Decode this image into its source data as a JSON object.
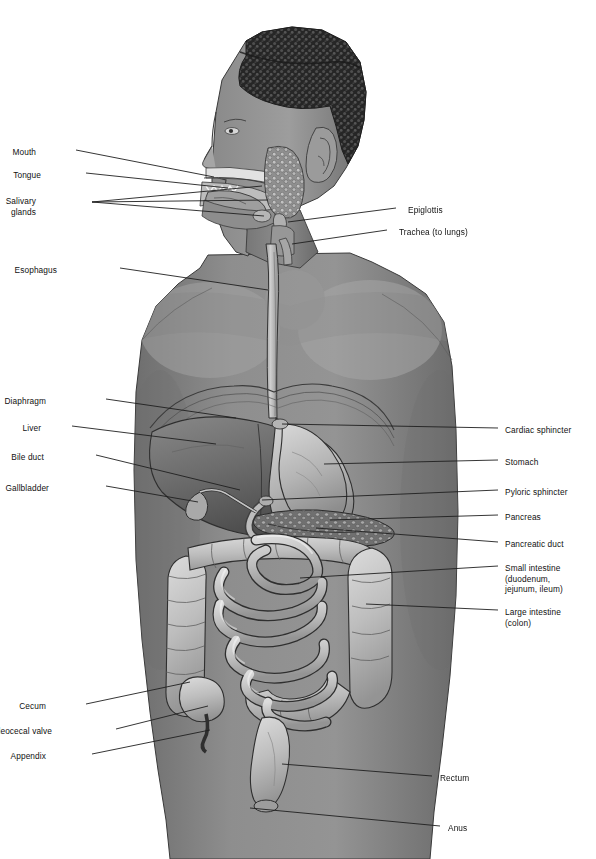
{
  "diagram": {
    "view": "lateral/anterior anatomical illustration",
    "style": "grayscale medical illustration",
    "palette": {
      "background": "#ffffff",
      "skin_light": "#9a9a9a",
      "skin_mid": "#808080",
      "skin_dark": "#6a6a6a",
      "organ_light": "#c9c9c9",
      "organ_mid": "#a3a3a3",
      "organ_dark": "#5d5d5d",
      "liver": "#6f6f6f",
      "hair": "#2a2a2a",
      "outline": "#2b2b2b",
      "leader_line": "#1f1f1f"
    }
  },
  "labels_left": [
    {
      "id": "mouth",
      "text": "Mouth",
      "x": 36,
      "y": 147
    },
    {
      "id": "tongue",
      "text": "Tongue",
      "x": 41,
      "y": 170
    },
    {
      "id": "salivary-glands",
      "text": "Salivary\nglands",
      "x": 36,
      "y": 196
    },
    {
      "id": "esophagus",
      "text": "Esophagus",
      "x": 57,
      "y": 265
    },
    {
      "id": "diaphragm",
      "text": "Diaphragm",
      "x": 46,
      "y": 396
    },
    {
      "id": "liver",
      "text": "Liver",
      "x": 41,
      "y": 423
    },
    {
      "id": "bile-duct",
      "text": "Bile duct",
      "x": 44,
      "y": 452
    },
    {
      "id": "gallbladder",
      "text": "Gallbladder",
      "x": 49,
      "y": 483
    },
    {
      "id": "cecum",
      "text": "Cecum",
      "x": 46,
      "y": 701
    },
    {
      "id": "ileocecal-valve",
      "text": "Ileocecal valve",
      "x": 52,
      "y": 726
    },
    {
      "id": "appendix",
      "text": "Appendix",
      "x": 46,
      "y": 751
    }
  ],
  "labels_right": [
    {
      "id": "epiglottis",
      "text": "Epiglottis",
      "x": 408,
      "y": 205
    },
    {
      "id": "trachea",
      "text": "Trachea (to lungs)",
      "x": 399,
      "y": 227
    },
    {
      "id": "cardiac-sphincter",
      "text": "Cardiac sphincter",
      "x": 505,
      "y": 425
    },
    {
      "id": "stomach",
      "text": "Stomach",
      "x": 505,
      "y": 457
    },
    {
      "id": "pyloric-sphincter",
      "text": "Pyloric sphincter",
      "x": 505,
      "y": 487
    },
    {
      "id": "pancreas",
      "text": "Pancreas",
      "x": 505,
      "y": 512
    },
    {
      "id": "pancreatic-duct",
      "text": "Pancreatic duct",
      "x": 505,
      "y": 539
    },
    {
      "id": "small-intestine",
      "text": "Small intestine\n(duodenum,\njejunum, ileum)",
      "x": 505,
      "y": 563
    },
    {
      "id": "large-intestine",
      "text": "Large intestine\n(colon)",
      "x": 505,
      "y": 607
    },
    {
      "id": "rectum",
      "text": "Rectum",
      "x": 440,
      "y": 773
    },
    {
      "id": "anus",
      "text": "Anus",
      "x": 448,
      "y": 823
    }
  ]
}
